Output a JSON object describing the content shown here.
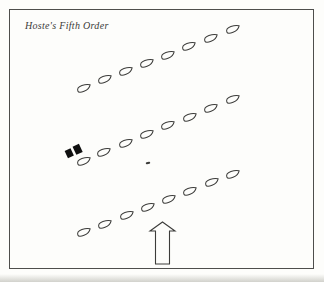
{
  "title": "Hoste's Fifth Order",
  "colors": {
    "paper": "#fdfdfb",
    "ink": "#3c3c3a",
    "frame": "#4e4e4c",
    "flag_black": "#101010"
  },
  "diagram": {
    "ship_icon_name": "ship-hull-icon",
    "ship_path": "M -6.8 0.8 C -6.8 -1.6 -4.4 -2.9 -1.2 -3 C 2.1 -3.1 5.3 -2.2 6.8 -1 C 5.6 1.2 2.4 2.9 -1 3.1 C -4.4 3.3 -6.8 2.6 -6.8 0.8 Z",
    "ship_rotation_deg": -19,
    "rows": [
      {
        "name": "top-column",
        "ships": [
          [
            84,
            88
          ],
          [
            105,
            79
          ],
          [
            126,
            71
          ],
          [
            147,
            63
          ],
          [
            168,
            55
          ],
          [
            189,
            46
          ],
          [
            211,
            38
          ],
          [
            233,
            29
          ]
        ]
      },
      {
        "name": "middle-column",
        "ships": [
          [
            84,
            161
          ],
          [
            104,
            152
          ],
          [
            126,
            143
          ],
          [
            147,
            134
          ],
          [
            168,
            125
          ],
          [
            190,
            117
          ],
          [
            211,
            108
          ],
          [
            233,
            99
          ]
        ]
      },
      {
        "name": "bottom-column",
        "ships": [
          [
            84,
            232
          ],
          [
            105,
            224
          ],
          [
            127,
            215
          ],
          [
            148,
            207
          ],
          [
            169,
            199
          ],
          [
            190,
            191
          ],
          [
            212,
            182
          ],
          [
            233,
            174
          ]
        ]
      }
    ],
    "flagship_marker": {
      "x": 74,
      "y": 151,
      "rotation_deg": -25,
      "blocks": [
        [
          -8.5,
          -4,
          6.5,
          8
        ],
        [
          0.5,
          -4.5,
          7,
          9
        ]
      ]
    },
    "small_mark": {
      "x": 148,
      "y": 163,
      "w": 4.5,
      "h": 2,
      "rotation_deg": -15
    },
    "arrow": {
      "points": "162.5,222 175,231 169.5,231 169.5,264 155.5,264 155.5,231 150,231"
    }
  }
}
